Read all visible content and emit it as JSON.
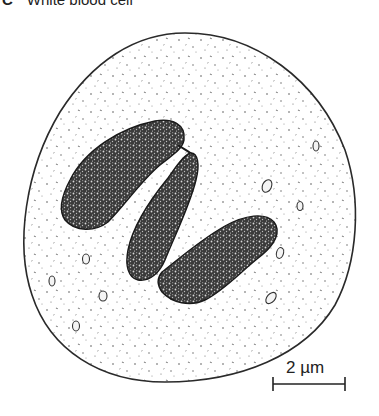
{
  "figure": {
    "panel_letter": "C",
    "title": "White blood cell"
  },
  "scale_bar": {
    "label": "2 µm",
    "value": 2,
    "unit": "µm"
  },
  "colors": {
    "outline": "#2a2a2a",
    "nucleus_fill": "#3a3a3a",
    "background": "#ffffff"
  }
}
